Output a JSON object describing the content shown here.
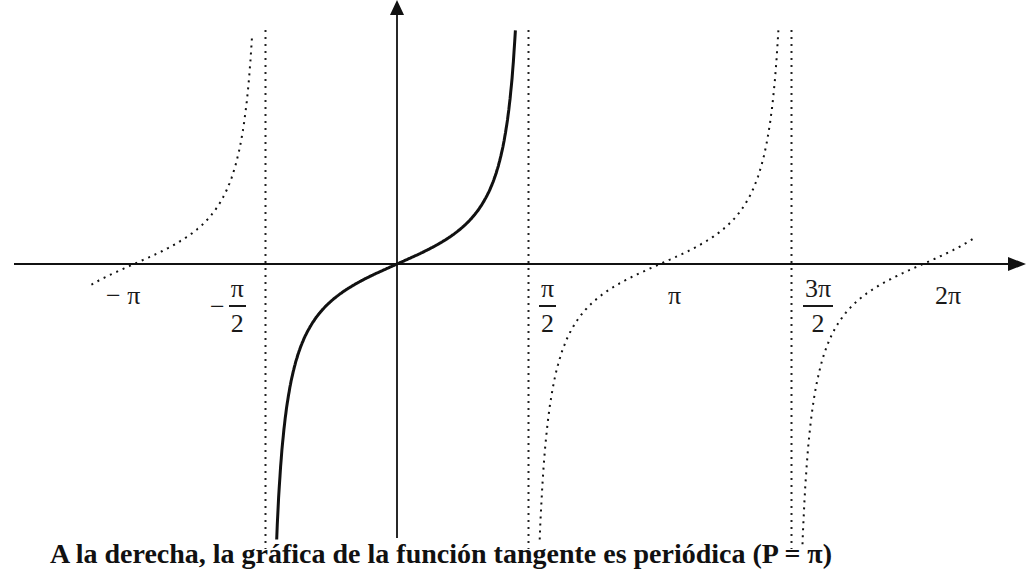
{
  "chart_data": {
    "type": "line",
    "title": "",
    "function": "tan(x)",
    "xlabel": "",
    "ylabel": "",
    "x_tick_labels": [
      "−π",
      "−π/2",
      "π/2",
      "π",
      "3π/2",
      "2π"
    ],
    "x_tick_values": [
      -3.14159,
      -1.5708,
      1.5708,
      3.14159,
      4.71239,
      6.28319
    ],
    "asymptotes": [
      -1.5708,
      1.5708,
      4.71239
    ],
    "asymptote_style": "dotted",
    "zeros": [
      -3.14159,
      0,
      3.14159,
      6.28319
    ],
    "series": [
      {
        "name": "tan(x) principal branch",
        "style": "solid",
        "domain": [
          -1.5708,
          1.5708
        ],
        "x": [
          -1.52,
          -1.4,
          -1.2,
          -1.0,
          -0.7,
          -0.4,
          0,
          0.4,
          0.7,
          1.0,
          1.2,
          1.4,
          1.48
        ],
        "y": [
          -20.0,
          -5.8,
          -2.57,
          -1.56,
          -0.84,
          -0.42,
          0,
          0.42,
          0.84,
          1.56,
          2.57,
          5.8,
          11.0
        ]
      },
      {
        "name": "tan(x) periodic copy",
        "style": "dotted",
        "domain": [
          -3.65,
          -1.5708
        ]
      },
      {
        "name": "tan(x) periodic copy",
        "style": "dotted",
        "domain": [
          1.5708,
          4.71239
        ]
      },
      {
        "name": "tan(x) periodic copy",
        "style": "dotted",
        "domain": [
          4.71239,
          6.9
        ]
      }
    ],
    "grid": false,
    "legend": "none",
    "axes": {
      "x_arrow": true,
      "y_arrow": true
    }
  },
  "labels": {
    "neg_pi": "− π",
    "neg_half_pi_minus": "−",
    "neg_half_pi_num": "π",
    "neg_half_pi_den": "2",
    "half_pi_num": "π",
    "half_pi_den": "2",
    "pi": "π",
    "three_half_pi_num": "3π",
    "three_half_pi_den": "2",
    "two_pi": "2π"
  },
  "caption": "A la derecha, la gráfica de la función tangente es periódica (P = π)"
}
